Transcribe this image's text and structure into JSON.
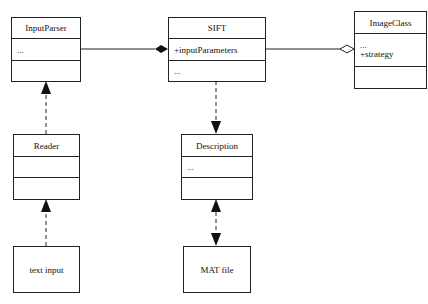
{
  "classes": {
    "input_parser": {
      "name": "InputParser",
      "attributes": "...",
      "operations": ""
    },
    "sift": {
      "name": "SIFT",
      "attributes": "+inputParameters",
      "operations": "..."
    },
    "image_class": {
      "name": "ImageClass",
      "attributes": [
        "...",
        "+strategy"
      ],
      "operations": ""
    },
    "reader": {
      "name": "Reader",
      "attributes": "",
      "operations": ""
    },
    "description": {
      "name": "Description",
      "attributes": "...",
      "operations": ""
    }
  },
  "nodes": {
    "text_input": {
      "label": "text input"
    },
    "mat_file": {
      "label": "MAT file"
    }
  },
  "relations": [
    {
      "from": "SIFT",
      "to": "InputParser",
      "type": "composition"
    },
    {
      "from": "SIFT",
      "to": "ImageClass",
      "type": "aggregation"
    },
    {
      "from": "Reader",
      "to": "InputParser",
      "type": "dependency"
    },
    {
      "from": "SIFT",
      "to": "Description",
      "type": "dependency"
    },
    {
      "from": "text input",
      "to": "Reader",
      "type": "dependency"
    },
    {
      "from": "Description",
      "to": "MAT file",
      "type": "bidirectional-dependency"
    }
  ]
}
